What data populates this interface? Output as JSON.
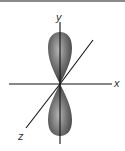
{
  "diagram": {
    "axes": {
      "y_label": "y",
      "x_label": "x",
      "z_label": "z"
    },
    "colors": {
      "lobe_dark": "#3a3a3a",
      "lobe_light": "#a8a8a8",
      "axis": "#111111",
      "top_border": "#8a8a8a"
    }
  }
}
